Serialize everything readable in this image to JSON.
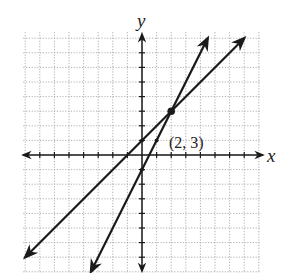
{
  "chart_data": {
    "type": "line",
    "title": "",
    "xlabel": "x",
    "ylabel": "y",
    "xlim": [
      -8,
      8
    ],
    "ylim": [
      -8,
      8
    ],
    "grid": true,
    "grid_style": "dotted",
    "tick_step": 1,
    "series": [
      {
        "name": "line-1",
        "equation": "y = x + 1",
        "slope": 1,
        "intercept": 1,
        "points": [
          [
            -8,
            -7
          ],
          [
            0,
            1
          ],
          [
            2,
            3
          ],
          [
            7,
            8
          ]
        ]
      },
      {
        "name": "line-2",
        "equation": "y = 2x - 1",
        "slope": 2,
        "intercept": -1,
        "points": [
          [
            -3.5,
            -8
          ],
          [
            0,
            -1
          ],
          [
            1,
            1
          ],
          [
            2,
            3
          ],
          [
            4.5,
            8
          ]
        ]
      }
    ],
    "annotations": [
      {
        "text": "(2, 3)",
        "x": 2,
        "y": 3,
        "type": "intersection-point"
      }
    ]
  },
  "labels": {
    "x_axis": "x",
    "y_axis": "y",
    "point": "(2, 3)"
  },
  "colors": {
    "line": "#1a1a1a",
    "grid": "#9a9a9a",
    "background": "#ffffff"
  }
}
